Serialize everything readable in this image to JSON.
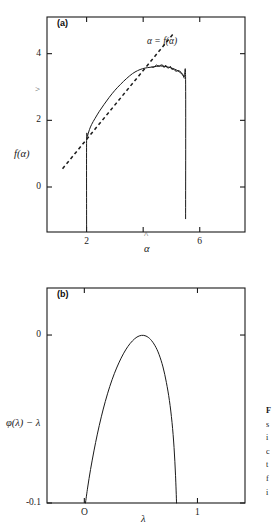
{
  "figure": {
    "background_color": "#ffffff",
    "ink_color": "#1a1a1a",
    "panels": [
      {
        "tag": "(a)",
        "annotation": "α = f(α)",
        "artifact_y": ">",
        "artifact_x": "^"
      },
      {
        "tag": "(b)"
      }
    ]
  },
  "caption": {
    "lines": [
      "F",
      "s",
      "i",
      "c",
      "t",
      "f",
      "i"
    ]
  },
  "chart_data": [
    {
      "type": "line",
      "panel": "(a)",
      "title": "",
      "xlabel": "α",
      "ylabel": "f(α)",
      "xlim": [
        0.6,
        7.6
      ],
      "ylim": [
        -1.35,
        5.1
      ],
      "grid": false,
      "legend": "none",
      "xticks": [
        2,
        4,
        6
      ],
      "xticklabels": [
        "2",
        "",
        "6"
      ],
      "yticks": [
        0,
        2,
        4
      ],
      "yticklabels": [
        "0",
        "2",
        "4"
      ],
      "annotations": [
        {
          "text": "α = f(α)",
          "x": 4.35,
          "y": 4.72
        },
        {
          "text": ">",
          "x": 1.52,
          "y": 3.58
        },
        {
          "text": "^",
          "x": 4.0,
          "y": -1.12
        }
      ],
      "series": [
        {
          "name": "f(alpha) spectrum",
          "style": "solid",
          "x": [
            2.0,
            2.0,
            2.03,
            2.1,
            2.18,
            2.3,
            2.45,
            2.62,
            2.8,
            3.0,
            3.2,
            3.42,
            3.62,
            3.8,
            3.98,
            4.15,
            4.32,
            4.48,
            4.62,
            4.75,
            4.88,
            5.0,
            5.1,
            5.2,
            5.3,
            5.38,
            5.45,
            5.5,
            5.5
          ],
          "y": [
            -1.2,
            1.4,
            1.52,
            1.72,
            1.88,
            2.06,
            2.27,
            2.48,
            2.69,
            2.9,
            3.08,
            3.26,
            3.4,
            3.49,
            3.55,
            3.58,
            3.6,
            3.62,
            3.63,
            3.62,
            3.6,
            3.57,
            3.54,
            3.5,
            3.44,
            3.38,
            3.3,
            3.22,
            -0.95
          ]
        },
        {
          "name": "alpha = f(alpha) tangent",
          "style": "dashed",
          "x": [
            1.15,
            5.05
          ],
          "y": [
            0.55,
            4.58
          ]
        }
      ]
    },
    {
      "type": "line",
      "panel": "(b)",
      "title": "",
      "xlabel": "λ",
      "ylabel": "φ(λ) − λ",
      "xlim": [
        -0.33,
        1.42
      ],
      "ylim": [
        -0.1,
        0.028
      ],
      "grid": false,
      "legend": "none",
      "xticks": [
        0,
        1
      ],
      "xticklabels": [
        "O",
        "1"
      ],
      "yticks": [
        0,
        -0.1
      ],
      "yticklabels": [
        "0",
        "-0.1"
      ],
      "series": [
        {
          "name": "phi(lambda) minus lambda",
          "style": "solid",
          "x": [
            0.01,
            0.03,
            0.055,
            0.085,
            0.115,
            0.15,
            0.185,
            0.225,
            0.265,
            0.305,
            0.345,
            0.385,
            0.425,
            0.465,
            0.505,
            0.545,
            0.585,
            0.625,
            0.66,
            0.695,
            0.725,
            0.752,
            0.775,
            0.793,
            0.806,
            0.815
          ],
          "y": [
            -0.1,
            -0.0905,
            -0.08,
            -0.069,
            -0.059,
            -0.0487,
            -0.0396,
            -0.0306,
            -0.023,
            -0.0166,
            -0.0112,
            -0.0068,
            -0.0035,
            -0.0012,
            -0.0002,
            -0.0006,
            -0.0026,
            -0.0064,
            -0.0115,
            -0.019,
            -0.0282,
            -0.039,
            -0.052,
            -0.067,
            -0.0835,
            -0.1
          ]
        }
      ]
    }
  ]
}
